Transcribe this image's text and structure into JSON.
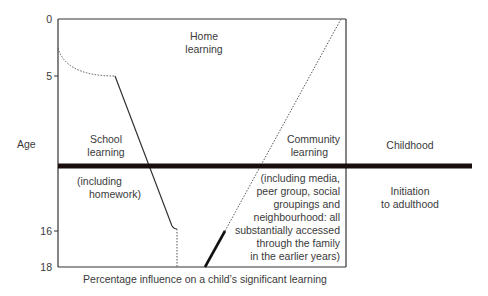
{
  "y_axis": {
    "label": "Age",
    "ticks": [
      "0",
      "5",
      "16",
      "18"
    ]
  },
  "x_axis": {
    "label": "Percentage influence on a child’s significant learning"
  },
  "regions": {
    "home": [
      "Home",
      "learning"
    ],
    "school": [
      "School",
      "learning"
    ],
    "school_note": [
      "(including",
      "homework)"
    ],
    "community": [
      "Community",
      "learning"
    ],
    "community_note": [
      "(including media,",
      "peer group, social",
      "groupings and",
      "neighbourhood: all",
      "substantially accessed",
      "through the family",
      "in the earlier years)"
    ]
  },
  "phases": {
    "childhood": "Childhood",
    "adulthood": [
      "Initiation",
      "to adulthood"
    ]
  }
}
